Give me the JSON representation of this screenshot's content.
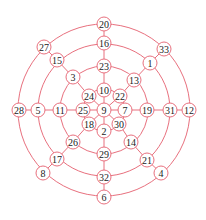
{
  "diagram": {
    "type": "concentric-graph",
    "center": {
      "x": 104,
      "y": 110
    },
    "ring_radii": [
      21,
      44,
      66,
      86
    ],
    "colors": {
      "stroke": "#e8707e",
      "node_fill": "#ffffff",
      "text": "#222222"
    },
    "node_radius": 7,
    "nodes": [
      {
        "id": "9",
        "label": "9",
        "x": 104,
        "y": 110
      },
      {
        "id": "10",
        "label": "10",
        "x": 104,
        "y": 90
      },
      {
        "id": "22",
        "label": "22",
        "x": 120,
        "y": 96
      },
      {
        "id": "7",
        "label": "7",
        "x": 125,
        "y": 110
      },
      {
        "id": "30",
        "label": "30",
        "x": 119,
        "y": 124
      },
      {
        "id": "2",
        "label": "2",
        "x": 104,
        "y": 131
      },
      {
        "id": "18",
        "label": "18",
        "x": 89,
        "y": 124
      },
      {
        "id": "25",
        "label": "25",
        "x": 83,
        "y": 110
      },
      {
        "id": "24",
        "label": "24",
        "x": 89,
        "y": 96
      },
      {
        "id": "23",
        "label": "23",
        "x": 104,
        "y": 66
      },
      {
        "id": "13",
        "label": "13",
        "x": 134,
        "y": 80
      },
      {
        "id": "19",
        "label": "19",
        "x": 147,
        "y": 110
      },
      {
        "id": "14",
        "label": "14",
        "x": 131,
        "y": 142
      },
      {
        "id": "29",
        "label": "29",
        "x": 104,
        "y": 154
      },
      {
        "id": "26",
        "label": "26",
        "x": 73,
        "y": 142
      },
      {
        "id": "11",
        "label": "11",
        "x": 60,
        "y": 110
      },
      {
        "id": "3",
        "label": "3",
        "x": 73,
        "y": 77
      },
      {
        "id": "16",
        "label": "16",
        "x": 104,
        "y": 43
      },
      {
        "id": "1",
        "label": "1",
        "x": 150,
        "y": 63
      },
      {
        "id": "31",
        "label": "31",
        "x": 170,
        "y": 110
      },
      {
        "id": "21",
        "label": "21",
        "x": 147,
        "y": 160
      },
      {
        "id": "32",
        "label": "32",
        "x": 104,
        "y": 177
      },
      {
        "id": "17",
        "label": "17",
        "x": 57,
        "y": 159
      },
      {
        "id": "5",
        "label": "5",
        "x": 38,
        "y": 110
      },
      {
        "id": "15",
        "label": "15",
        "x": 57,
        "y": 60
      },
      {
        "id": "20",
        "label": "20",
        "x": 104,
        "y": 24
      },
      {
        "id": "33",
        "label": "33",
        "x": 164,
        "y": 49
      },
      {
        "id": "12",
        "label": "12",
        "x": 189,
        "y": 110
      },
      {
        "id": "4",
        "label": "4",
        "x": 161,
        "y": 173
      },
      {
        "id": "6",
        "label": "6",
        "x": 104,
        "y": 197
      },
      {
        "id": "8",
        "label": "8",
        "x": 43,
        "y": 173
      },
      {
        "id": "28",
        "label": "28",
        "x": 19,
        "y": 110
      },
      {
        "id": "27",
        "label": "27",
        "x": 44,
        "y": 47
      }
    ],
    "spokes": [
      [
        "9",
        "10",
        "23",
        "16",
        "20"
      ],
      [
        "9",
        "22",
        "13",
        "1",
        "33"
      ],
      [
        "9",
        "7",
        "19",
        "31",
        "12"
      ],
      [
        "9",
        "30",
        "14",
        "21",
        "4"
      ],
      [
        "9",
        "2",
        "29",
        "32",
        "6"
      ],
      [
        "9",
        "18",
        "26",
        "17",
        "8"
      ],
      [
        "9",
        "25",
        "11",
        "5",
        "28"
      ],
      [
        "9",
        "24",
        "3",
        "15",
        "27"
      ]
    ]
  }
}
